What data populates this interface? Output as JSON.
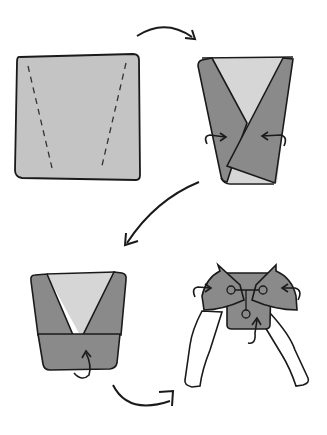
{
  "diagram": {
    "steps": [
      {
        "id": 1,
        "description": "Flat square cloth with two dashed fold lines"
      },
      {
        "id": 2,
        "description": "Sides folded inward into a V-shaped trapezoid"
      },
      {
        "id": 3,
        "description": "Bottom edge folded up"
      },
      {
        "id": 4,
        "description": "Diaper fastened on baby with pin"
      }
    ],
    "colors": {
      "cloth_light": "#c4c4c4",
      "cloth_mid": "#8a8a8a",
      "cloth_inner": "#d6d6d6",
      "outline": "#1a1a1a",
      "background": "#ffffff"
    }
  }
}
